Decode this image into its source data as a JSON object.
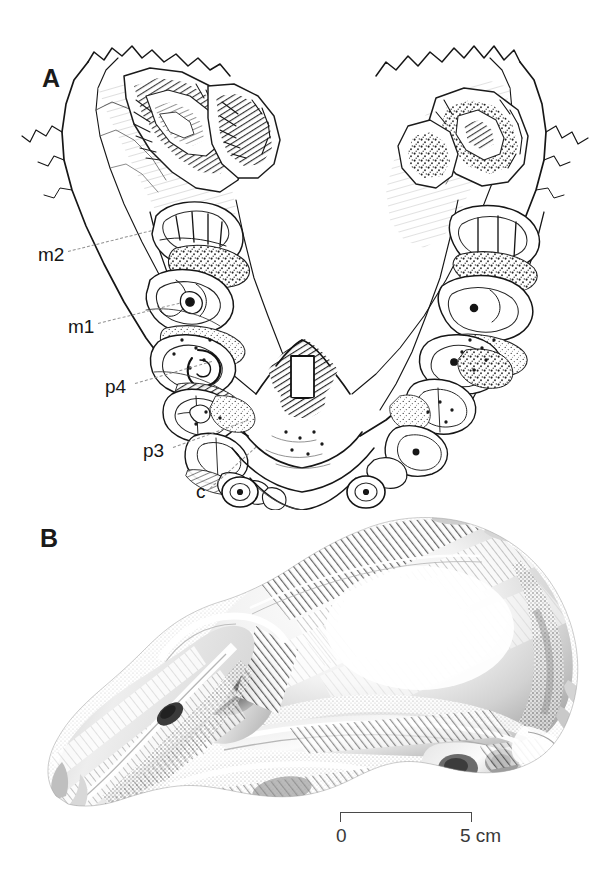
{
  "figure": {
    "kind": "scientific-illustration-plate",
    "background_color": "#ffffff",
    "ink_color": "#161616",
    "leader_color": "#8c8c8c",
    "width": 606,
    "height": 880
  },
  "panels": [
    {
      "id": "A",
      "letter": "A",
      "subject": "mandible-occlusal-view",
      "description": "V-shaped lower jaw seen from above with tooth rows on both sides"
    },
    {
      "id": "B",
      "letter": "B",
      "subject": "skull-lateral-view",
      "description": "halftone rendering of a skull in left lateral view"
    }
  ],
  "tooth_labels": [
    {
      "text": "m2",
      "x": 38,
      "y": 245,
      "leader_length": 86,
      "leader_angle": -14
    },
    {
      "text": "m1",
      "x": 68,
      "y": 317,
      "leader_length": 84,
      "leader_angle": -14
    },
    {
      "text": "p4",
      "x": 105,
      "y": 377,
      "leader_length": 80,
      "leader_angle": -16
    },
    {
      "text": "p3",
      "x": 143,
      "y": 441,
      "leader_length": 80,
      "leader_angle": -20
    },
    {
      "text": "c",
      "x": 196,
      "y": 482,
      "leader_length": 62,
      "leader_angle": -42
    }
  ],
  "scale_bar": {
    "min_label": "0",
    "max_label": "5 cm",
    "value": 5,
    "unit": "cm",
    "bar_color": "#4a4a4a"
  }
}
